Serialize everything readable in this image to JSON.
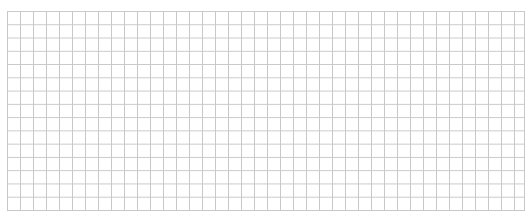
{
  "grid": {
    "columns": 40,
    "rows": 15,
    "cell_size_px": 13,
    "line_color": "#c8c8c8",
    "background_color": "#ffffff"
  }
}
